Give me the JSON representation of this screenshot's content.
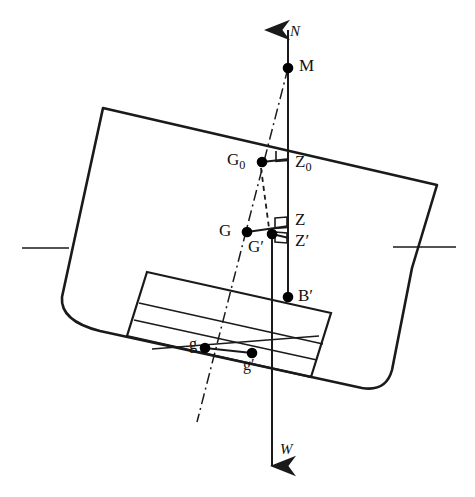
{
  "figure": {
    "type": "naval-architecture-stability-diagram",
    "background_color": "#ffffff",
    "line_color": "#1a1a1a",
    "point_color": "#000000",
    "heel_angle_deg": 14
  },
  "labels": {
    "force_up": "N",
    "metacentre": "M",
    "g_zero": "G",
    "g_zero_sub": "0",
    "z_zero": "Z",
    "z_zero_sub": "0",
    "g": "G",
    "g_prime": "G′",
    "z": "Z",
    "z_prime": "Z′",
    "b_prime": "B′",
    "tank_g": "g",
    "tank_g_prime": "g′",
    "force_down": "W"
  },
  "points": {
    "M": {
      "x": 288,
      "y": 68,
      "label": "M",
      "r": 5.2
    },
    "G0": {
      "x": 262,
      "y": 162,
      "label": "G0",
      "r": 5.2
    },
    "G": {
      "x": 247,
      "y": 232,
      "label": "G",
      "r": 5.2
    },
    "Gp": {
      "x": 272,
      "y": 234,
      "label": "G'",
      "r": 5.2
    },
    "Bp": {
      "x": 288,
      "y": 297,
      "label": "B'",
      "r": 5.2
    },
    "g": {
      "x": 205,
      "y": 348,
      "label": "g",
      "r": 5.2
    },
    "gp": {
      "x": 252,
      "y": 353,
      "label": "g'",
      "r": 5.2
    }
  },
  "lines": {
    "vertical_MB": {
      "from": [
        288,
        28
      ],
      "to": [
        288,
        297
      ],
      "style": "solid",
      "note": "buoyancy vertical through M, Z0, Z, Z', B'"
    },
    "vertical_W": {
      "from": [
        272,
        234
      ],
      "to": [
        272,
        462
      ],
      "style": "solid",
      "note": "weight vertical through G' down to W"
    },
    "dashed_G0": {
      "from": [
        262,
        166
      ],
      "to": [
        268,
        228
      ],
      "style": "dashed",
      "note": "G0 to G' construction line"
    },
    "centreline": {
      "from": [
        288,
        68
      ],
      "to": [
        197,
        422
      ],
      "style": "dash-dot",
      "note": "ship centreline through M"
    },
    "G0_Z0": {
      "from": [
        262,
        162
      ],
      "to": [
        288,
        160
      ],
      "style": "solid"
    },
    "G_Z": {
      "from": [
        247,
        232
      ],
      "to": [
        288,
        226
      ],
      "style": "solid"
    },
    "Gp_Zp": {
      "from": [
        272,
        234
      ],
      "to": [
        288,
        238
      ],
      "style": "solid"
    },
    "g_gp": {
      "from": [
        205,
        348
      ],
      "to": [
        252,
        353
      ],
      "style": "solid"
    },
    "waterline_left": {
      "from": [
        22,
        248
      ],
      "to": [
        68,
        248
      ]
    },
    "waterline_right": {
      "from": [
        392,
        247
      ],
      "to": [
        455,
        247
      ]
    }
  },
  "arrows": {
    "N": {
      "tip": [
        288,
        22
      ],
      "direction": "up",
      "label": "N"
    },
    "W": {
      "tip": [
        272,
        478
      ],
      "direction": "down",
      "label": "W"
    }
  },
  "hull": {
    "deck_left": [
      103,
      108
    ],
    "deck_right": [
      437,
      185
    ],
    "chine_left": [
      62,
      300
    ],
    "chine_right": [
      392,
      370
    ]
  },
  "tank": {
    "note": "rotated rectangular tank with free liquid surfaces",
    "corners": [
      [
        147,
        272
      ],
      [
        330,
        313
      ],
      [
        310,
        376
      ],
      [
        128,
        335
      ]
    ],
    "free_surface_lines": 3
  },
  "right_angle_markers": [
    {
      "at": "Z0",
      "x": 275,
      "y": 152
    },
    {
      "at": "Z",
      "x": 275,
      "y": 219
    },
    {
      "at": "Z'",
      "x": 275,
      "y": 232
    }
  ]
}
